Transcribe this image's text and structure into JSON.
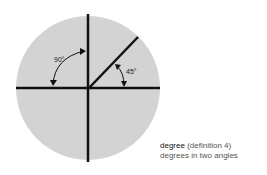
{
  "diagram": {
    "angles": [
      {
        "label": "90°",
        "degrees": 90
      },
      {
        "label": "45°",
        "degrees": 45
      }
    ],
    "colors": {
      "disc": "#d3d3d3",
      "lines": "#111111",
      "background": "#ffffff"
    }
  },
  "caption": {
    "term": "degree",
    "definition_ref": "(definition 4)",
    "text": "degrees in two angles"
  }
}
